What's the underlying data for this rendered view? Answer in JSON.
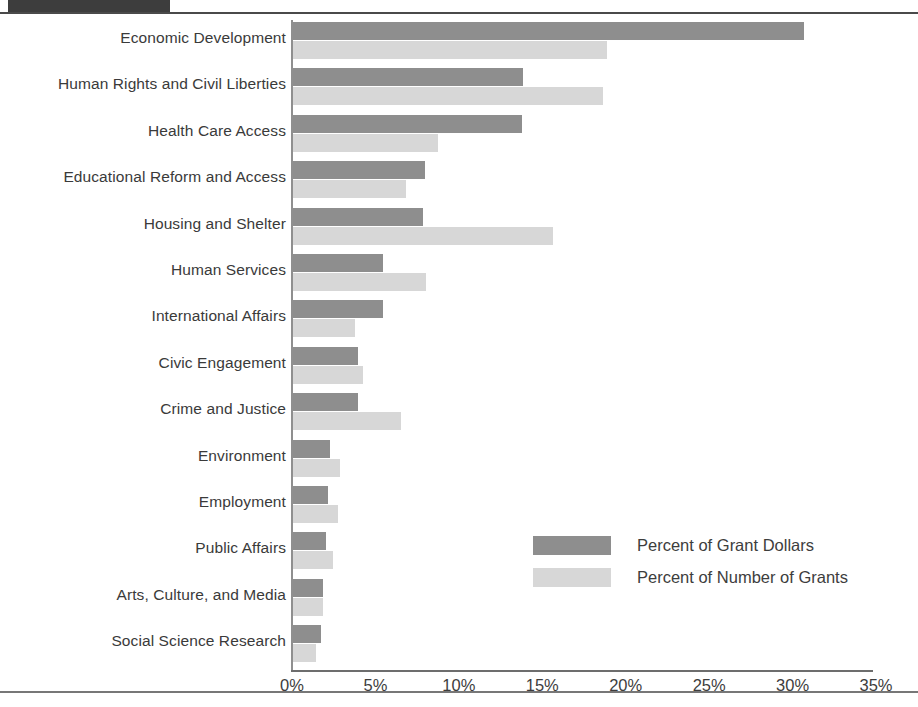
{
  "chart_data": {
    "type": "bar",
    "orientation": "horizontal",
    "title": "",
    "xlabel": "",
    "ylabel": "",
    "xlim": [
      0,
      35
    ],
    "xticks": [
      "0%",
      "5%",
      "10%",
      "15%",
      "20%",
      "25%",
      "30%",
      "35%"
    ],
    "xtick_values": [
      0,
      5,
      10,
      15,
      20,
      25,
      30,
      35
    ],
    "grid": false,
    "legend_position": "inside-lower-right",
    "categories": [
      "Economic Development",
      "Human Rights and Civil Liberties",
      "Health Care Access",
      "Educational Reform and Access",
      "Housing and Shelter",
      "Human Services",
      "International Affairs",
      "Civic Engagement",
      "Crime and Justice",
      "Environment",
      "Employment",
      "Public Affairs",
      "Arts, Culture, and Media",
      "Social Science Research"
    ],
    "series": [
      {
        "name": "Percent of Grant Dollars",
        "color": "#8e8e8e",
        "values": [
          30.6,
          13.8,
          13.7,
          7.9,
          7.8,
          5.4,
          5.4,
          3.9,
          3.9,
          2.2,
          2.1,
          2.0,
          1.8,
          1.7
        ]
      },
      {
        "name": "Percent of Number of Grants",
        "color": "#d7d7d7",
        "values": [
          18.8,
          18.6,
          8.7,
          6.8,
          15.6,
          8.0,
          3.7,
          4.2,
          6.5,
          2.8,
          2.7,
          2.4,
          1.8,
          1.4
        ]
      }
    ]
  },
  "legend": {
    "items": [
      {
        "label": "Percent of Grant Dollars",
        "color": "#8e8e8e"
      },
      {
        "label": "Percent of Number of Grants",
        "color": "#d7d7d7"
      }
    ]
  },
  "colors": {
    "dollars": "#8e8e8e",
    "grants": "#d7d7d7",
    "axis": "#8f8f8f",
    "text": "#3a3a3a",
    "rule": "#4a4a4a"
  }
}
